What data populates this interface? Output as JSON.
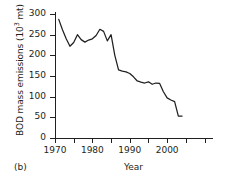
{
  "panel": {
    "tag": "(b)"
  },
  "chart_data": {
    "type": "line",
    "title": "",
    "xlabel": "Year",
    "ylabel": "BOD mass emissions (10³ mt)",
    "ylabel_base": "BOD mass emissions (10",
    "ylabel_exp": "3",
    "ylabel_tail": " mt)",
    "grid": false,
    "legend": "none",
    "xlim": [
      1970,
      2012
    ],
    "ylim": [
      0,
      300
    ],
    "xticks": [
      1970,
      1980,
      1990,
      2000
    ],
    "xtick_labels": [
      "1970",
      "1980",
      "1990",
      "2000"
    ],
    "xminor_ticks": [
      1975,
      1985,
      1995,
      2005,
      2010
    ],
    "yticks": [
      0,
      50,
      100,
      150,
      200,
      250,
      300
    ],
    "ytick_labels": [
      "0",
      "50",
      "100",
      "150",
      "200",
      "250",
      "300"
    ],
    "line_color": "#231f20",
    "x": [
      1971,
      1972,
      1973,
      1974,
      1975,
      1976,
      1977,
      1978,
      1979,
      1980,
      1981,
      1982,
      1983,
      1984,
      1985,
      1986,
      1987,
      1988,
      1989,
      1990,
      1991,
      1992,
      1993,
      1994,
      1995,
      1996,
      1997,
      1998,
      1999,
      2000,
      2001,
      2002,
      2003,
      2004
    ],
    "values": [
      287,
      262,
      240,
      222,
      231,
      250,
      238,
      232,
      237,
      240,
      248,
      263,
      258,
      235,
      250,
      200,
      165,
      162,
      160,
      156,
      148,
      138,
      135,
      133,
      136,
      130,
      133,
      132,
      112,
      97,
      92,
      88,
      53,
      53
    ],
    "units": "10^3 mt",
    "series_name": "BOD mass emissions"
  }
}
